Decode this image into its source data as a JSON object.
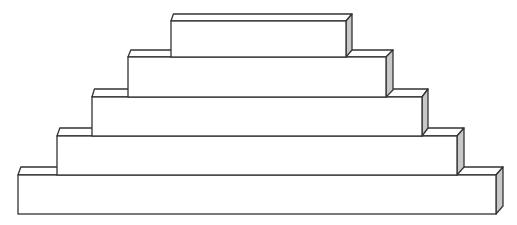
{
  "diagram": {
    "type": "stacked-blocks-pyramid",
    "background": "#ffffff",
    "stroke_color": "#333333",
    "front_fill": "#ffffff",
    "top_fill": "#ffffff",
    "side_fill": "#c8c8c8",
    "levels": [
      {
        "name": "level-5-top",
        "x": 171,
        "front_top": 21,
        "bottom": 57,
        "right": 346,
        "depth_x": 6,
        "depth_y": 7
      },
      {
        "name": "level-4",
        "x": 128,
        "front_top": 57,
        "bottom": 97,
        "right": 386,
        "depth_x": 7,
        "depth_y": 7
      },
      {
        "name": "level-3",
        "x": 92,
        "front_top": 97,
        "bottom": 136,
        "right": 422,
        "depth_x": 6,
        "depth_y": 8
      },
      {
        "name": "level-2",
        "x": 57,
        "front_top": 136,
        "bottom": 175,
        "right": 457,
        "depth_x": 7,
        "depth_y": 8
      },
      {
        "name": "level-1-bottom",
        "x": 18,
        "front_top": 175,
        "bottom": 214,
        "right": 496,
        "depth_x": 7,
        "depth_y": 8
      }
    ]
  }
}
